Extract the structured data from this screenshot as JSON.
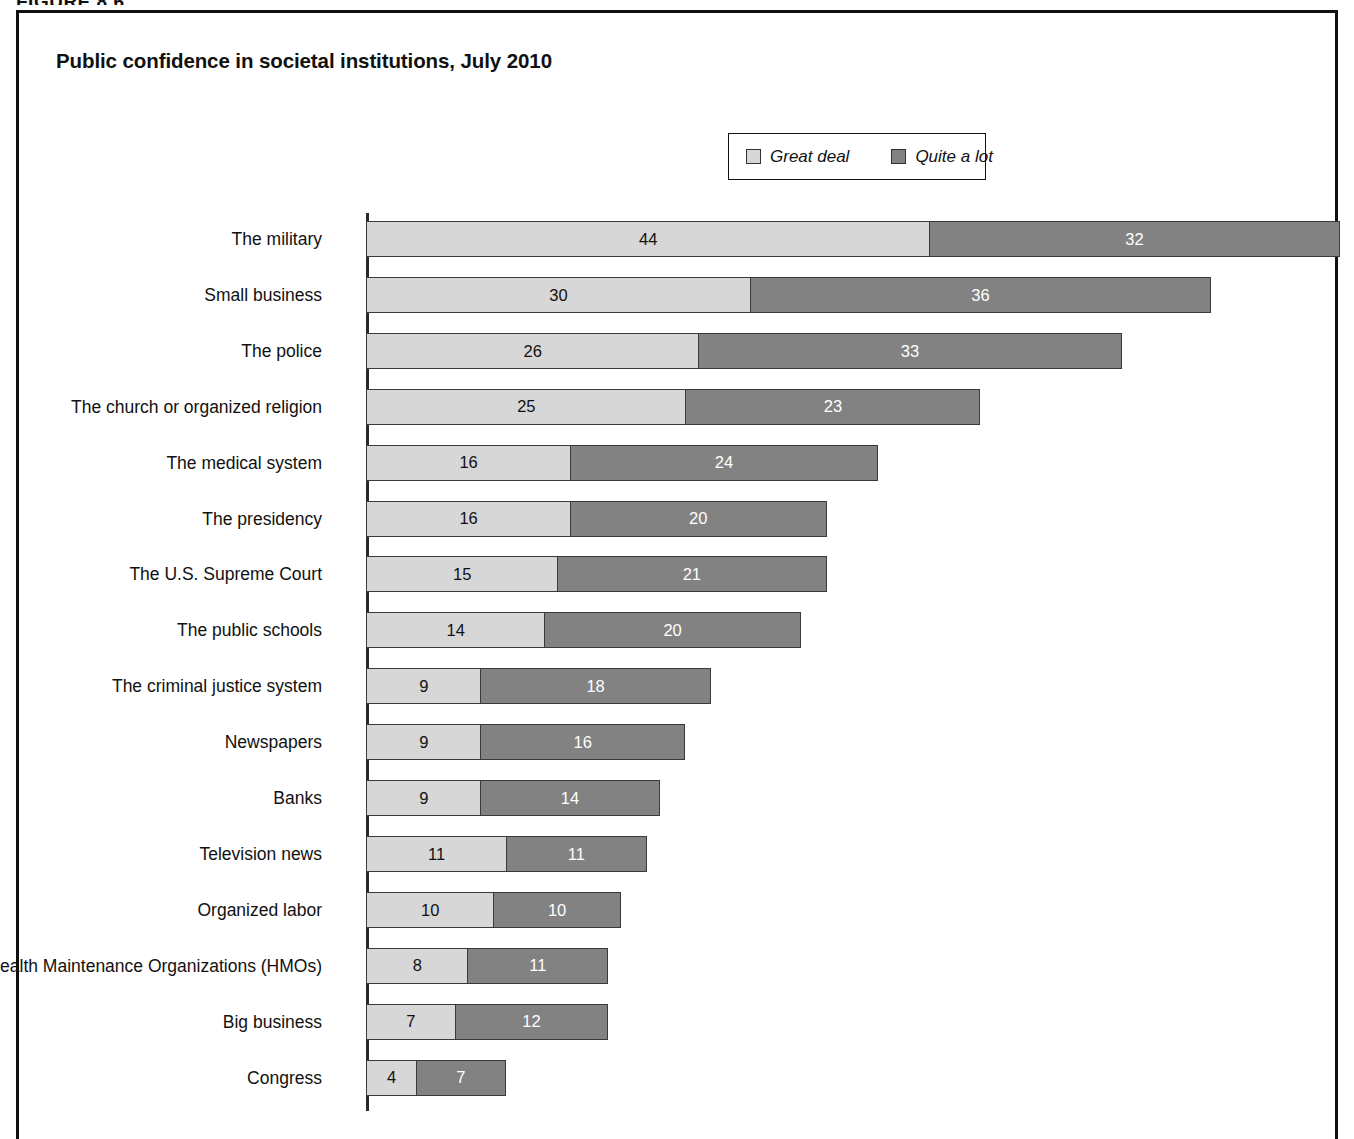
{
  "figure_caption": "FIGURE 8.6",
  "title": "Public confidence in societal institutions, July 2010",
  "legend": {
    "items": [
      {
        "label": "Great deal",
        "color": "#d7d7d7",
        "key": "great_deal"
      },
      {
        "label": "Quite a lot",
        "color": "#828282",
        "key": "quite_a_lot"
      }
    ]
  },
  "colors": {
    "great_deal": "#d7d7d7",
    "quite_a_lot": "#828282",
    "frame": "#111111",
    "axis": "#2a2a2a",
    "bar_outline": "#3a3a3a",
    "background": "#ffffff"
  },
  "chart_data": {
    "type": "bar",
    "orientation": "horizontal",
    "stacked": true,
    "title": "Public confidence in societal institutions, July 2010",
    "xlabel": "",
    "ylabel": "",
    "xlim": [
      0,
      76
    ],
    "grid": false,
    "axis_ticks_visible": false,
    "legend_position": "top-center",
    "categories": [
      "The military",
      "Small business",
      "The police",
      "The church or organized religion",
      "The medical system",
      "The presidency",
      "The U.S. Supreme Court",
      "The public schools",
      "The criminal justice system",
      "Newspapers",
      "Banks",
      "Television news",
      "Organized labor",
      "Health Maintenance Organizations (HMOs)",
      "Big business",
      "Congress"
    ],
    "series": [
      {
        "name": "Great deal",
        "color": "#d7d7d7",
        "values": [
          44,
          30,
          26,
          25,
          16,
          16,
          15,
          14,
          9,
          9,
          9,
          11,
          10,
          8,
          7,
          4
        ]
      },
      {
        "name": "Quite a lot",
        "color": "#828282",
        "values": [
          32,
          36,
          33,
          23,
          24,
          20,
          21,
          20,
          18,
          16,
          14,
          11,
          10,
          11,
          12,
          7
        ]
      }
    ],
    "totals": [
      76,
      66,
      59,
      48,
      40,
      36,
      36,
      34,
      27,
      25,
      23,
      22,
      20,
      19,
      19,
      11
    ]
  }
}
